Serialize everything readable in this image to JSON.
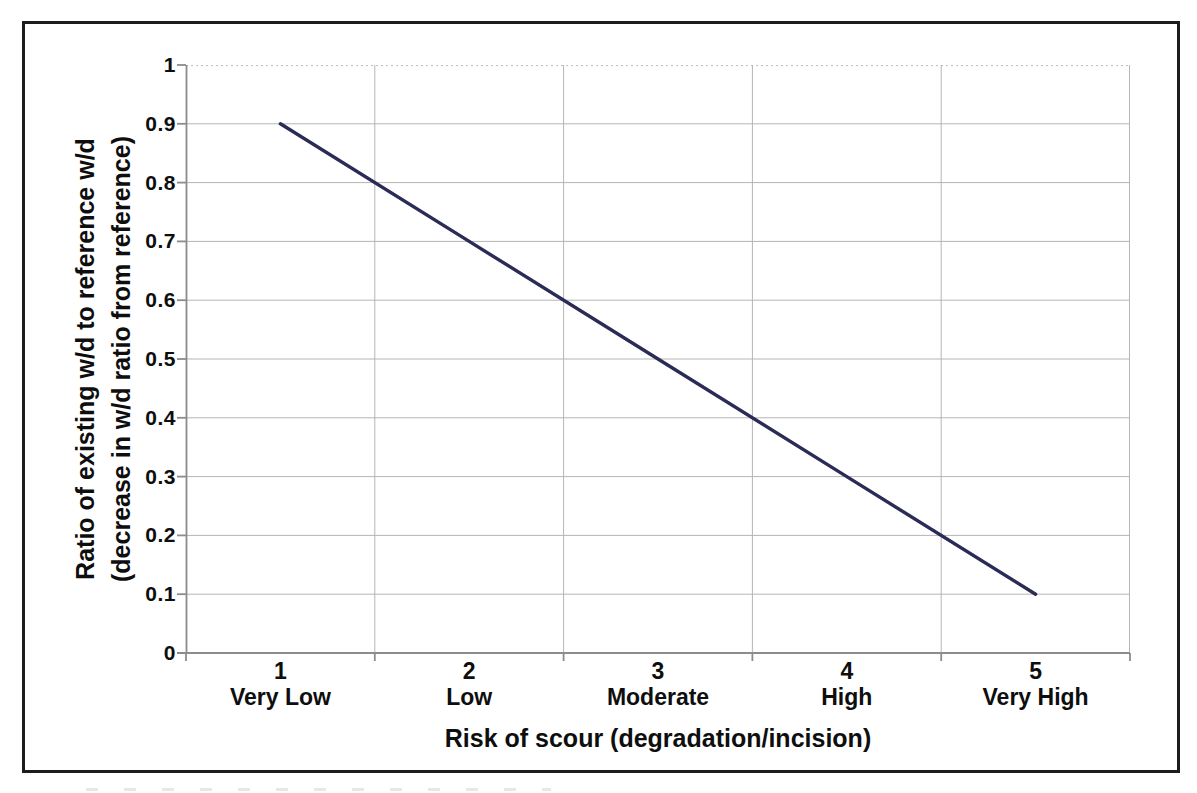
{
  "page": {
    "background": "#ffffff"
  },
  "frame": {
    "border_color": "#1c1c1c"
  },
  "chart_data": {
    "type": "line",
    "title": "",
    "x": [
      1,
      2,
      3,
      4,
      5
    ],
    "categories": [
      "1",
      "2",
      "3",
      "4",
      "5"
    ],
    "category_labels": [
      "Very Low",
      "Low",
      "Moderate",
      "High",
      "Very High"
    ],
    "values": [
      0.9,
      0.7,
      0.5,
      0.3,
      0.1
    ],
    "xlabel": "Risk of scour (degradation/incision)",
    "ylabel": "Ratio of existing w/d to reference w/d (decrease in w/d ratio from reference)",
    "ylabel_lines": [
      "Ratio of existing w/d to reference w/d",
      "(decrease in w/d ratio from reference)"
    ],
    "ylim": [
      0,
      1
    ],
    "ytick_step": 0.1,
    "ytick_labels": [
      "0",
      "0.1",
      "0.2",
      "0.3",
      "0.4",
      "0.5",
      "0.6",
      "0.7",
      "0.8",
      "0.9",
      "1"
    ],
    "grid": {
      "horizontal": true,
      "vertical": true,
      "top_gridline_style": "dotted"
    },
    "legend": "none",
    "colors": {
      "line": "#2b2b57",
      "gridline": "#b5b5b5",
      "axis": "#8c8c8c",
      "text": "#0e0e0e"
    }
  }
}
